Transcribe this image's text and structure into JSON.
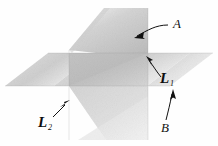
{
  "figure": {
    "background_color": "#fefefe",
    "ink_color": "#111111"
  },
  "labels": {
    "plane_a": "A",
    "plane_b": "B",
    "line_1_name": "L",
    "line_1_subscript": "1",
    "line_2_name": "L",
    "line_2_subscript": "2"
  },
  "planes": [
    {
      "name": "plane-a",
      "label": "A",
      "orientation": "vertical-tilted",
      "fill_light": "#ededed",
      "fill_dark": "#b9b9b9"
    },
    {
      "name": "plane-b",
      "label": "B",
      "orientation": "horizontal",
      "fill_light": "#efefef",
      "fill_dark": "#c2c2c2"
    }
  ],
  "lines": [
    {
      "name": "line-l1",
      "label": "L",
      "subscript": "1"
    },
    {
      "name": "line-l2",
      "label": "L",
      "subscript": "2"
    }
  ]
}
